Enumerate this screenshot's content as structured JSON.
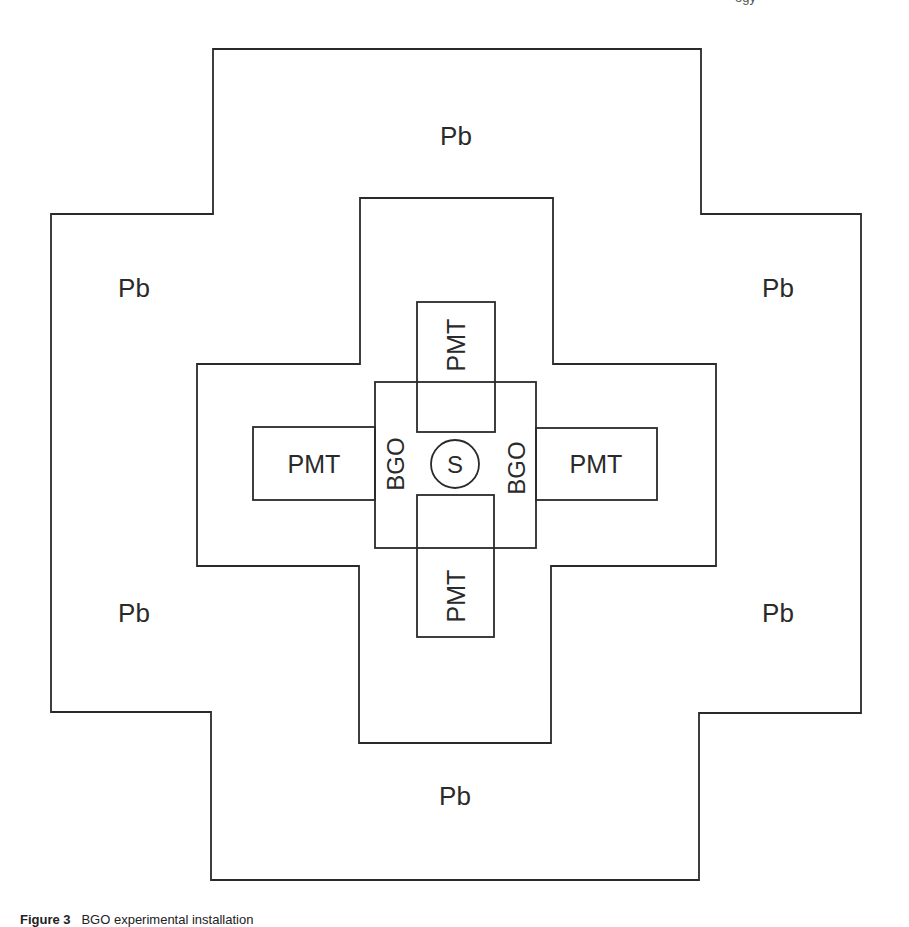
{
  "figure": {
    "caption_label": "Figure 3",
    "caption_text": "BGO experimental installation",
    "header_fragment": "ogy"
  },
  "labels": {
    "lead": "Pb",
    "pmt": "PMT",
    "bgo": "BGO",
    "source": "S"
  },
  "regions": {
    "lead_top": "Pb",
    "lead_left_upper": "Pb",
    "lead_right_upper": "Pb",
    "lead_left_lower": "Pb",
    "lead_right_lower": "Pb",
    "lead_bottom": "Pb",
    "pmt_left": "PMT",
    "pmt_right": "PMT",
    "pmt_top": "PMT",
    "pmt_bottom": "PMT",
    "bgo_left": "BGO",
    "bgo_right": "BGO",
    "source": "S"
  },
  "colors": {
    "line": "#2a2a2a",
    "background": "#ffffff"
  }
}
